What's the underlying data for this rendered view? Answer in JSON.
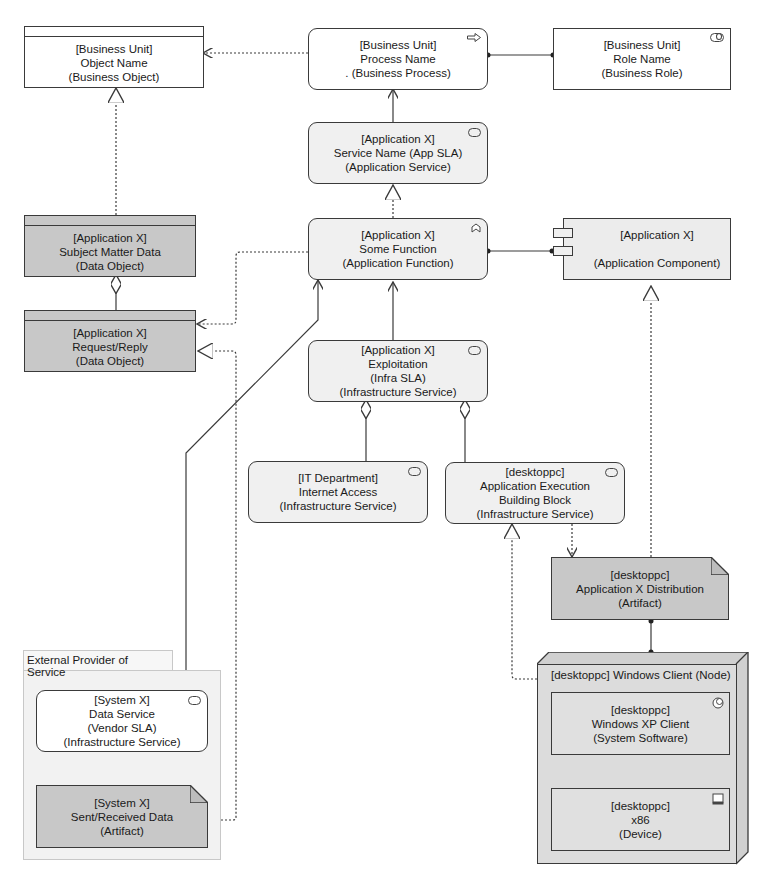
{
  "diagram": {
    "type": "ArchiMate layered view",
    "elements": {
      "business_object": {
        "lines": [
          "[Business Unit]",
          "Object Name",
          "(Business Object)"
        ]
      },
      "business_process": {
        "lines": [
          "[Business Unit]",
          "Process Name",
          ". (Business Process)"
        ],
        "icon": "process-arrow-icon"
      },
      "business_role": {
        "lines": [
          "[Business Unit]",
          "Role Name",
          "(Business Role)"
        ],
        "icon": "role-icon"
      },
      "app_service": {
        "lines": [
          "[Application X]",
          "Service Name (App SLA)",
          "(Application Service)"
        ],
        "icon": "service-icon"
      },
      "app_function": {
        "lines": [
          "[Application X]",
          "Some Function",
          "(Application Function)"
        ],
        "icon": "function-chevron-icon"
      },
      "app_component": {
        "lines": [
          "[Application X]",
          "",
          "(Application Component)"
        ],
        "icon": "component-icon"
      },
      "data_subject": {
        "lines": [
          "[Application X]",
          "Subject Matter Data",
          "(Data Object)"
        ]
      },
      "data_request": {
        "lines": [
          "[Application X]",
          "Request/Reply",
          "(Data Object)"
        ]
      },
      "infra_exploitation": {
        "lines": [
          "[Application X]",
          "Exploitation",
          "(Infra SLA)",
          "(Infrastructure Service)"
        ],
        "icon": "service-icon"
      },
      "infra_internet": {
        "lines": [
          "[IT Department]",
          "Internet Access",
          "(Infrastructure Service)"
        ],
        "icon": "service-icon"
      },
      "infra_aebb": {
        "lines": [
          "[desktoppc]",
          "Application Execution",
          "Building Block",
          "(Infrastructure Service)"
        ],
        "icon": "service-icon"
      },
      "artifact_distribution": {
        "lines": [
          "[desktoppc]",
          "Application X Distribution",
          "(Artifact)"
        ]
      },
      "node_windows_client": {
        "title": "[desktoppc] Windows Client (Node)"
      },
      "system_software": {
        "lines": [
          "[desktoppc]",
          "Windows XP Client",
          "(System Software)"
        ],
        "icon": "system-software-icon"
      },
      "device": {
        "lines": [
          "[desktoppc]",
          "x86",
          "(Device)"
        ],
        "icon": "device-icon"
      },
      "external_group": {
        "title": "External Provider of Service"
      },
      "data_service": {
        "lines": [
          "[System X]",
          "Data Service",
          "(Vendor SLA)",
          "(Infrastructure Service)"
        ],
        "icon": "service-icon"
      },
      "artifact_sent_received": {
        "lines": [
          "[System X]",
          "Sent/Received Data",
          "(Artifact)"
        ]
      }
    },
    "colors": {
      "stroke": "#3a3a3a",
      "white_fill": "#ffffff",
      "light_fill": "#f0f0f0",
      "dark_fill": "#c8c8c8",
      "node_fill": "#dcdcdc",
      "group_fill": "#f2f2f2"
    }
  }
}
